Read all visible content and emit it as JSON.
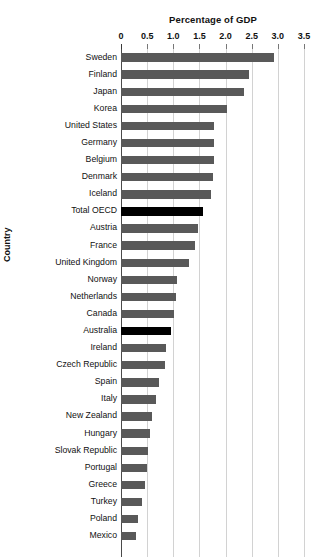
{
  "chart_data": {
    "type": "bar",
    "orientation": "horizontal",
    "title": "",
    "xlabel": "Percentage of GDP",
    "ylabel": "Country",
    "xlim": [
      0,
      3.5
    ],
    "xticks": [
      "0",
      "0.5",
      "1.0",
      "1.5",
      "2.0",
      "2.5",
      "3.0",
      "3.5"
    ],
    "xtick_values": [
      0,
      0.5,
      1.0,
      1.5,
      2.0,
      2.5,
      3.0,
      3.5
    ],
    "grid": "vertical",
    "legend": "none",
    "bar_color": "#595959",
    "highlight_color": "#000000",
    "categories": [
      "Sweden",
      "Finland",
      "Japan",
      "Korea",
      "United States",
      "Germany",
      "Belgium",
      "Denmark",
      "Iceland",
      "Total OECD",
      "Austria",
      "France",
      "United Kingdom",
      "Norway",
      "Netherlands",
      "Canada",
      "Australia",
      "Ireland",
      "Czech Republic",
      "Spain",
      "Italy",
      "New Zealand",
      "Hungary",
      "Slovak Republic",
      "Portugal",
      "Greece",
      "Turkey",
      "Poland",
      "Mexico"
    ],
    "values": [
      2.93,
      2.45,
      2.35,
      2.02,
      1.78,
      1.78,
      1.77,
      1.76,
      1.72,
      1.56,
      1.48,
      1.42,
      1.3,
      1.08,
      1.06,
      1.01,
      0.95,
      0.86,
      0.85,
      0.72,
      0.67,
      0.6,
      0.56,
      0.52,
      0.49,
      0.45,
      0.4,
      0.32,
      0.28
    ],
    "highlighted": [
      "Total OECD",
      "Australia"
    ]
  }
}
